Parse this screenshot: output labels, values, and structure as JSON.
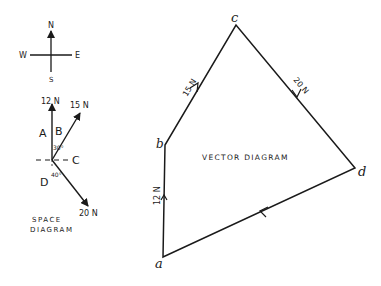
{
  "compass": {
    "north": "N",
    "south": "S",
    "east": "E",
    "west": "W"
  },
  "space_diagram": {
    "title_line1": "SPACE",
    "title_line2": "DIAGRAM",
    "forces": [
      {
        "label": "12 N",
        "direction": "north"
      },
      {
        "label": "15 N",
        "direction": "N30°E"
      },
      {
        "label": "20 N",
        "direction": "S40°E"
      }
    ],
    "regions": [
      "A",
      "B",
      "C",
      "D"
    ],
    "angles": [
      "30°",
      "40°"
    ]
  },
  "vector_diagram": {
    "title": "VECTOR DIAGRAM",
    "points": [
      "a",
      "b",
      "c",
      "d"
    ],
    "vectors": [
      {
        "from": "a",
        "to": "b",
        "label": "12 N"
      },
      {
        "from": "b",
        "to": "c",
        "label": "15 N"
      },
      {
        "from": "c",
        "to": "d",
        "label": "20 N"
      },
      {
        "from": "d",
        "to": "a",
        "label": ""
      }
    ]
  },
  "colors": {
    "ink": "#1a1a1a",
    "background": "#ffffff"
  }
}
